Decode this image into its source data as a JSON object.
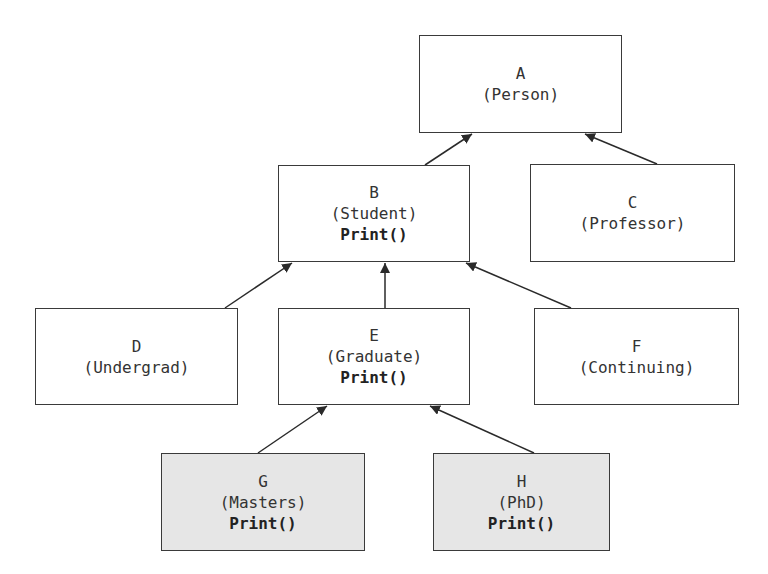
{
  "diagram": {
    "type": "class-inheritance-hierarchy",
    "colors": {
      "border": "#3a3a3a",
      "box_fill": "#ffffff",
      "highlight_fill": "#e6e6e6",
      "arrow": "#2a2a2a",
      "text": "#333333"
    },
    "nodes": [
      {
        "id": "A",
        "letter": "A",
        "class_name": "(Person)",
        "method": "",
        "shaded": false,
        "x": 419,
        "y": 35,
        "w": 203,
        "h": 98
      },
      {
        "id": "B",
        "letter": "B",
        "class_name": "(Student)",
        "method": "Print()",
        "shaded": false,
        "x": 278,
        "y": 165,
        "w": 192,
        "h": 97
      },
      {
        "id": "C",
        "letter": "C",
        "class_name": "(Professor)",
        "method": "",
        "shaded": false,
        "x": 530,
        "y": 164,
        "w": 205,
        "h": 98
      },
      {
        "id": "D",
        "letter": "D",
        "class_name": "(Undergrad)",
        "method": "",
        "shaded": false,
        "x": 35,
        "y": 308,
        "w": 203,
        "h": 97
      },
      {
        "id": "E",
        "letter": "E",
        "class_name": "(Graduate)",
        "method": "Print()",
        "shaded": false,
        "x": 278,
        "y": 308,
        "w": 192,
        "h": 97
      },
      {
        "id": "F",
        "letter": "F",
        "class_name": "(Continuing)",
        "method": "",
        "shaded": false,
        "x": 534,
        "y": 308,
        "w": 205,
        "h": 97
      },
      {
        "id": "G",
        "letter": "G",
        "class_name": "(Masters)",
        "method": "Print()",
        "shaded": true,
        "x": 161,
        "y": 453,
        "w": 204,
        "h": 98
      },
      {
        "id": "H",
        "letter": "H",
        "class_name": "(PhD)",
        "method": "Print()",
        "shaded": true,
        "x": 433,
        "y": 453,
        "w": 177,
        "h": 98
      }
    ],
    "edges": [
      {
        "from": "B",
        "to": "A",
        "x1": 425,
        "y1": 165,
        "x2": 472,
        "y2": 134
      },
      {
        "from": "C",
        "to": "A",
        "x1": 657,
        "y1": 164,
        "x2": 585,
        "y2": 134
      },
      {
        "from": "D",
        "to": "B",
        "x1": 225,
        "y1": 308,
        "x2": 292,
        "y2": 263
      },
      {
        "from": "E",
        "to": "B",
        "x1": 385,
        "y1": 308,
        "x2": 385,
        "y2": 263
      },
      {
        "from": "F",
        "to": "B",
        "x1": 571,
        "y1": 308,
        "x2": 466,
        "y2": 263
      },
      {
        "from": "G",
        "to": "E",
        "x1": 258,
        "y1": 453,
        "x2": 327,
        "y2": 406
      },
      {
        "from": "H",
        "to": "E",
        "x1": 534,
        "y1": 453,
        "x2": 430,
        "y2": 406
      }
    ]
  }
}
